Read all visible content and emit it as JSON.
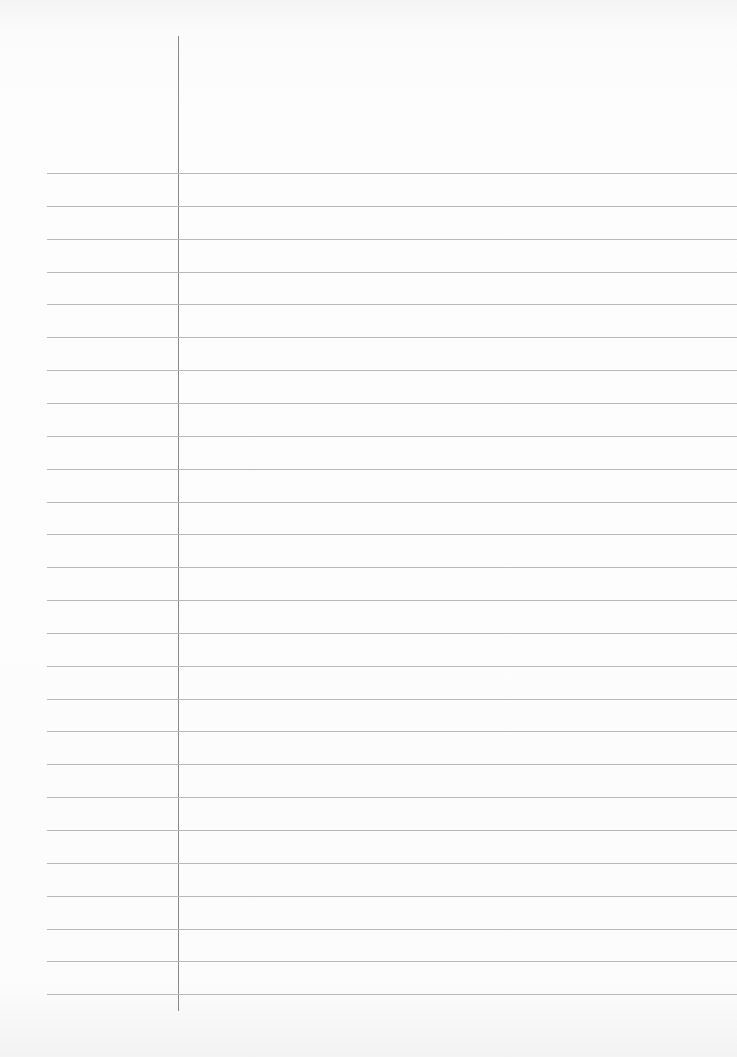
{
  "paper": {
    "type": "lined-notebook-paper",
    "margin_line": {
      "x": 178,
      "top": 36,
      "bottom": 1011,
      "color": "#8a8a8a"
    },
    "rules": {
      "count": 26,
      "first_y": 173,
      "spacing": 32.85,
      "left": 47,
      "color": "#b9b9b9"
    },
    "content": ""
  }
}
